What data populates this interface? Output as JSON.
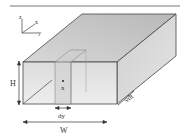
{
  "diagram": {
    "type": "3d-rectangular-channel",
    "labels": {
      "height": "H",
      "width": "W",
      "slice_width": "dy",
      "depth": "vdt",
      "point": "x"
    },
    "axes": {
      "z": "z",
      "x": "x",
      "y": "y"
    },
    "colors": {
      "top_face": "#c4c4c4",
      "side_face": "#d4d4d4",
      "front_face": "#e6e6e6",
      "slice": "#d0d0d0",
      "edge": "#444444"
    }
  }
}
